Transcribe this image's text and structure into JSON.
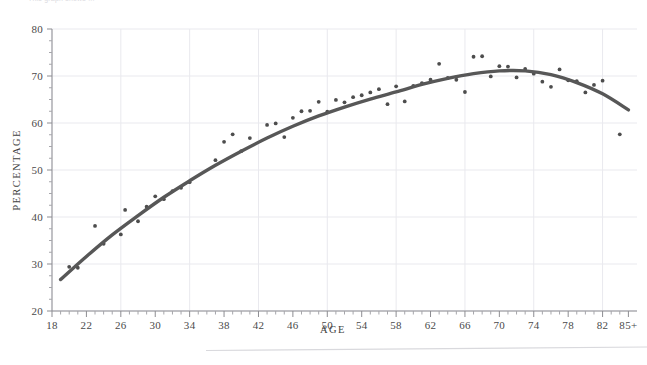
{
  "figure": {
    "clipped_top_caption": "This graph shows ...",
    "background_color": "#ffffff"
  },
  "axis": {
    "x_title": "AGE",
    "y_title": "PERCENTAGE",
    "x_tick_labels": [
      "18",
      "22",
      "26",
      "30",
      "34",
      "38",
      "42",
      "46",
      "50",
      "54",
      "58",
      "62",
      "66",
      "70",
      "74",
      "78",
      "82",
      "85+"
    ],
    "y_tick_labels": [
      "20",
      "30",
      "40",
      "50",
      "60",
      "70",
      "80"
    ]
  },
  "style": {
    "line_color": "#575757",
    "point_color": "#4d4d4d",
    "grid_color": "#e9e9ee",
    "axis_color": "#8d8d92"
  },
  "chart_data": {
    "type": "scatter",
    "title": "",
    "subtitle": "",
    "xlabel": "AGE",
    "ylabel": "PERCENTAGE",
    "xlim": [
      18,
      86
    ],
    "ylim": [
      20,
      80
    ],
    "xtick_step_major": 4,
    "xtick_step_minor": 1,
    "ytick_step_major": 10,
    "ytick_step_minor": 2.5,
    "grid": true,
    "grid_x_step": 8,
    "grid_y_step": 10,
    "legend": null,
    "legend_position": "none",
    "series": [
      {
        "name": "Observed percentage by age",
        "type": "scatter",
        "x": [
          20,
          21,
          23,
          24,
          26,
          26.5,
          28,
          29,
          30,
          31,
          32,
          33,
          34,
          37,
          38,
          39,
          40,
          41,
          43,
          44,
          45,
          46,
          47,
          48,
          49,
          50,
          51,
          52,
          53,
          54,
          55,
          56,
          57,
          58,
          59,
          60,
          61,
          62,
          63,
          64,
          65,
          66,
          67,
          68,
          69,
          70,
          71,
          72,
          73,
          74,
          75,
          76,
          77,
          78,
          79,
          80,
          81,
          82,
          84
        ],
        "y": [
          29.4,
          29.2,
          38.1,
          34.3,
          36.3,
          41.5,
          39.1,
          42.2,
          44.4,
          43.8,
          45.5,
          46.2,
          47.4,
          52.1,
          56.0,
          57.6,
          54.0,
          56.8,
          59.6,
          59.9,
          57.0,
          61.1,
          62.5,
          62.6,
          64.5,
          62.4,
          64.9,
          64.4,
          65.5,
          65.9,
          66.5,
          67.2,
          64.0,
          67.8,
          64.6,
          67.9,
          68.5,
          69.2,
          72.6,
          69.6,
          69.2,
          66.6,
          74.1,
          74.2,
          69.9,
          72.1,
          72.0,
          69.7,
          71.5,
          70.5,
          68.8,
          67.7,
          71.4,
          69.1,
          68.9,
          66.5,
          68.1,
          69.0,
          57.6
        ]
      },
      {
        "name": "Fitted trend",
        "type": "line",
        "x": [
          19,
          22,
          25,
          28,
          31,
          34,
          37,
          40,
          43,
          46,
          49,
          52,
          55,
          58,
          61,
          64,
          67,
          70,
          73,
          76,
          79,
          82,
          85
        ],
        "y": [
          26.7,
          31.6,
          36.2,
          40.3,
          44.2,
          47.7,
          51.0,
          54.0,
          56.8,
          59.3,
          61.5,
          63.4,
          65.1,
          66.6,
          68.2,
          69.5,
          70.5,
          71.1,
          71.1,
          70.3,
          68.6,
          66.2,
          62.8
        ]
      }
    ]
  },
  "footer": {
    "rule_visible": true
  }
}
